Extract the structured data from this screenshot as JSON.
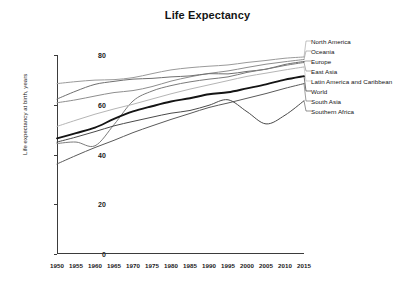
{
  "chart_data": {
    "type": "line",
    "title": "Life Expectancy",
    "xlabel": "",
    "ylabel": "Life expectancy at birth, years",
    "xlim": [
      1950,
      2015
    ],
    "ylim": [
      0,
      80
    ],
    "grid": false,
    "legend_position": "right-outside-with-leader-lines",
    "x": [
      1950,
      1955,
      1960,
      1965,
      1970,
      1975,
      1980,
      1985,
      1990,
      1995,
      2000,
      2005,
      2010,
      2015
    ],
    "xticks": [
      "1950",
      "1955",
      "1960",
      "1965",
      "1970",
      "1975",
      "1980",
      "1985",
      "1990",
      "1995",
      "2000",
      "2005",
      "2010",
      "2015"
    ],
    "yticks": [
      "0",
      "20",
      "40",
      "60",
      "80"
    ],
    "series": [
      {
        "name": "North America",
        "color": "#9a9a9a",
        "width": 1.0,
        "values": [
          68.5,
          69.3,
          69.9,
          70.1,
          70.9,
          72.5,
          74.0,
          74.9,
          75.5,
          76.0,
          77.0,
          77.8,
          78.7,
          79.2
        ]
      },
      {
        "name": "Oceania",
        "color": "#8e8e8e",
        "width": 1.0,
        "values": [
          60.8,
          62.0,
          63.5,
          64.9,
          65.7,
          67.3,
          69.5,
          71.2,
          72.6,
          73.6,
          75.0,
          76.3,
          77.3,
          78.2
        ]
      },
      {
        "name": "Europe",
        "color": "#6f6f6f",
        "width": 1.0,
        "values": [
          62.3,
          65.5,
          68.2,
          69.4,
          70.3,
          70.6,
          71.2,
          71.6,
          72.5,
          72.4,
          73.4,
          74.3,
          76.2,
          77.4
        ]
      },
      {
        "name": "East Asia",
        "color": "#7b7b7b",
        "width": 1.0,
        "values": [
          44.4,
          45.0,
          43.5,
          52.0,
          61.5,
          65.5,
          67.7,
          69.2,
          70.3,
          71.2,
          73.0,
          74.3,
          75.8,
          77.0
        ]
      },
      {
        "name": "Latin America and Caribbean",
        "color": "#b5b5b5",
        "width": 1.0,
        "values": [
          51.3,
          53.8,
          56.2,
          58.3,
          60.2,
          62.3,
          64.4,
          66.3,
          68.0,
          69.7,
          71.4,
          72.7,
          74.0,
          75.2
        ]
      },
      {
        "name": "World",
        "color": "#141414",
        "width": 1.9,
        "values": [
          46.5,
          48.6,
          50.8,
          54.3,
          57.3,
          59.4,
          61.3,
          62.6,
          64.2,
          65.0,
          66.6,
          68.2,
          70.1,
          71.5
        ]
      },
      {
        "name": "South Asia",
        "color": "#5a5a5a",
        "width": 1.0,
        "values": [
          36.2,
          39.6,
          42.8,
          45.7,
          48.8,
          51.5,
          54.1,
          56.5,
          58.9,
          60.7,
          62.6,
          64.5,
          66.6,
          68.5
        ]
      },
      {
        "name": "Southern Africa",
        "color": "#4a4a4a",
        "width": 1.0,
        "values": [
          45.0,
          47.0,
          49.2,
          51.5,
          53.3,
          55.0,
          56.6,
          57.7,
          59.8,
          62.0,
          57.2,
          52.3,
          55.8,
          61.6
        ]
      }
    ],
    "legend_entries": [
      {
        "label": "North America",
        "y": 41
      },
      {
        "label": "Oceania",
        "y": 51
      },
      {
        "label": "Europe",
        "y": 61
      },
      {
        "label": "East Asia",
        "y": 71
      },
      {
        "label": "Latin America and Caribbean",
        "y": 81
      },
      {
        "label": "World",
        "y": 91
      },
      {
        "label": "South Asia",
        "y": 101
      },
      {
        "label": "Southern Africa",
        "y": 111
      }
    ]
  }
}
